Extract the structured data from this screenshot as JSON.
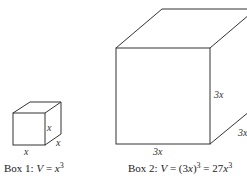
{
  "figure": {
    "box1": {
      "edge_label_front_right": "x",
      "edge_label_depth": "x",
      "edge_label_bottom": "x",
      "caption_prefix": "Box 1:  ",
      "caption_var": "V",
      "caption_eq": " = ",
      "caption_base": "x",
      "caption_exp": "3"
    },
    "box2": {
      "edge_label_front_right": "3x",
      "edge_label_depth": "3x",
      "edge_label_bottom": "3x",
      "caption_prefix": "Box 2:  ",
      "caption_var": "V",
      "caption_eq": " = (3",
      "caption_x": "x",
      "caption_close": ")",
      "caption_exp1": "3",
      "caption_eq2": " = 27",
      "caption_x2": "x",
      "caption_exp2": "3"
    }
  }
}
